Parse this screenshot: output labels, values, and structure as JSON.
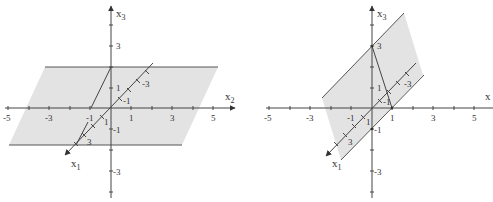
{
  "panels": [
    {
      "id": "left",
      "axes": {
        "x1": "x",
        "x1_sub": "1",
        "x2": "x",
        "x2_sub": "2",
        "x3": "x",
        "x3_sub": "3"
      },
      "horizontal_ticks": [
        "-5",
        "-3",
        "-1",
        "1",
        "3",
        "5"
      ],
      "vertical_ticks": [
        "3",
        "1",
        "-1",
        "-3"
      ],
      "diagonal_ticks": [
        "-3",
        "-1",
        "1",
        "3"
      ],
      "plane_color": "#e3e3e3"
    },
    {
      "id": "right",
      "axes": {
        "x1": "x",
        "x1_sub": "1",
        "x2": "x",
        "x3": "x",
        "x3_sub": "3"
      },
      "horizontal_ticks": [
        "-5",
        "-3",
        "-1",
        "1",
        "3",
        "5"
      ],
      "vertical_ticks": [
        "3",
        "1",
        "-1",
        "-3"
      ],
      "diagonal_ticks": [
        "-3",
        "-1",
        "1",
        "3"
      ],
      "plane_color": "#e3e3e3"
    }
  ]
}
